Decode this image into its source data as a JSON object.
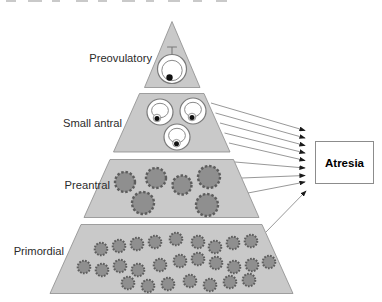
{
  "diagram": {
    "tiers": [
      {
        "label": "Preovulatory",
        "follicles": 1
      },
      {
        "label": "Small antral",
        "follicles": 3
      },
      {
        "label": "Preantral",
        "follicles": 6
      },
      {
        "label": "Primordial",
        "follicles": 27
      }
    ],
    "outcome": {
      "label": "Atresia"
    },
    "arrows": {
      "from_small_antral": 5,
      "from_preantral": 3,
      "from_primordial": 1,
      "total": 9
    },
    "colors": {
      "tier_fill": "#c9c9c9",
      "tier_border": "#8c8c8c",
      "follicle_light": "#ffffff",
      "follicle_dark": "#8f8f8f",
      "follicle_ring": "#5d5d5d",
      "oocyte_dot": "#111111",
      "arrow_line": "#7d7d7d",
      "arrowhead": "#1a1a1a",
      "box_background": "#ffffff",
      "box_border": "#8c8c8c",
      "label_text": "#2b2b2b"
    }
  }
}
